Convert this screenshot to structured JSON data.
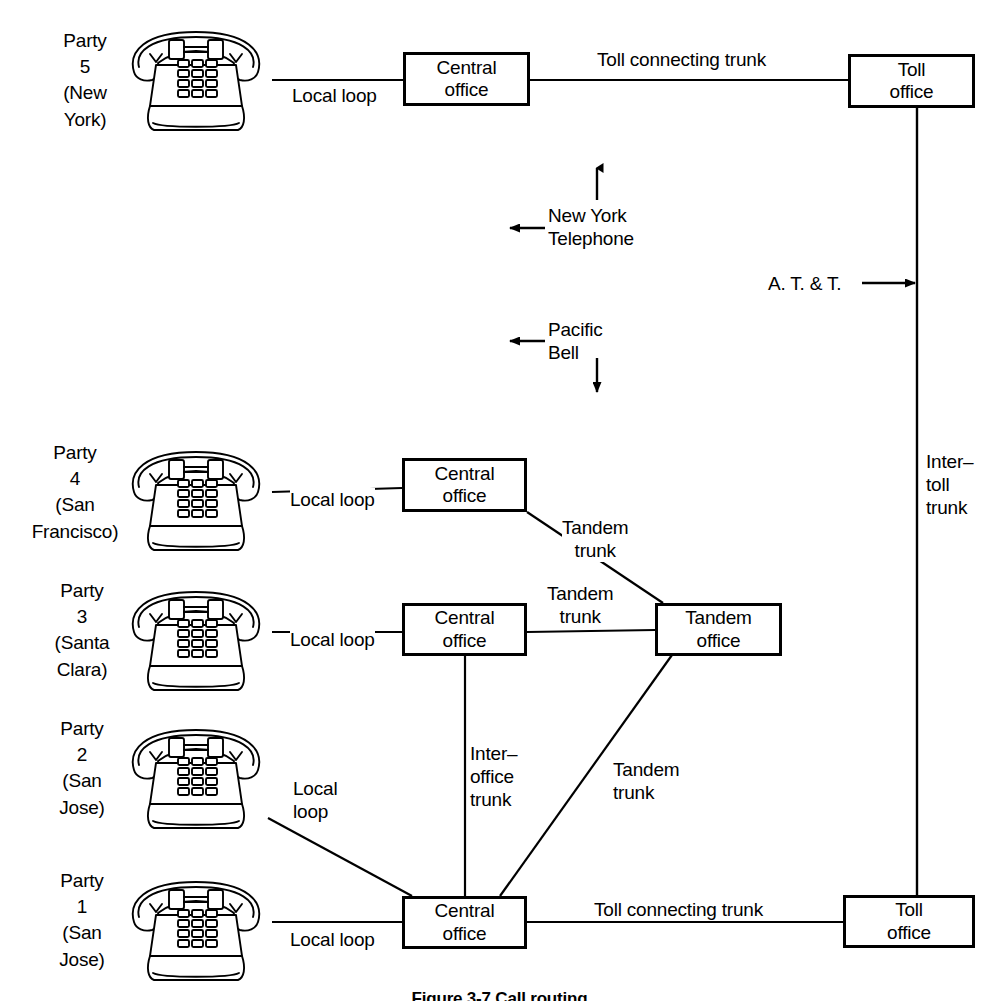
{
  "figure": {
    "caption": "Figure 3-7  Call routing"
  },
  "parties": [
    {
      "id": "party-5",
      "name": "Party",
      "number": "5",
      "location": "(New\nYork)",
      "label": "Party\n5\n(New\nYork)",
      "phone_icon": "desk-telephone-icon"
    },
    {
      "id": "party-4",
      "name": "Party",
      "number": "4",
      "location": "(San\nFrancisco)",
      "label": "Party\n4\n(San\nFrancisco)",
      "phone_icon": "desk-telephone-icon"
    },
    {
      "id": "party-3",
      "name": "Party",
      "number": "3",
      "location": "(Santa\nClara)",
      "label": "Party\n3\n(Santa\nClara)",
      "phone_icon": "desk-telephone-icon"
    },
    {
      "id": "party-2",
      "name": "Party",
      "number": "2",
      "location": "(San\nJose)",
      "label": "Party\n2\n(San\nJose)",
      "phone_icon": "desk-telephone-icon"
    },
    {
      "id": "party-1",
      "name": "Party",
      "number": "1",
      "location": "(San\nJose)",
      "label": "Party\n1\n(San\nJose)",
      "phone_icon": "desk-telephone-icon"
    }
  ],
  "nodes": {
    "central_office_ny": {
      "line1": "Central",
      "line2": "office"
    },
    "toll_office_ny": {
      "line1": "Toll",
      "line2": "office"
    },
    "central_office_sf": {
      "line1": "Central",
      "line2": "office"
    },
    "central_office_sc": {
      "line1": "Central",
      "line2": "office"
    },
    "tandem_office": {
      "line1": "Tandem",
      "line2": "office"
    },
    "central_office_sj": {
      "line1": "Central",
      "line2": "office"
    },
    "toll_office_sj": {
      "line1": "Toll",
      "line2": "office"
    }
  },
  "edges": {
    "local_loop_p5": "Local loop",
    "toll_connecting_trunk_top": "Toll connecting trunk",
    "local_loop_p4": "Local loop",
    "tandem_trunk_sf": "Tandem\ntrunk",
    "tandem_trunk_sc": "Tandem\ntrunk",
    "local_loop_p3": "Local loop",
    "local_loop_p2": "Local\nloop",
    "interoffice_trunk": "Inter–\noffice\ntrunk",
    "tandem_trunk_sj": "Tandem\ntrunk",
    "local_loop_p1": "Local loop",
    "toll_connecting_trunk_bottom": "Toll connecting trunk",
    "intertoll_trunk": "Inter–\ntoll\ntrunk"
  },
  "boundaries": {
    "new_york_telephone": "New York\nTelephone",
    "pacific_bell": "Pacific\nBell",
    "att": "A. T. & T."
  },
  "colors": {
    "ink": "#000000",
    "paper": "#ffffff"
  }
}
